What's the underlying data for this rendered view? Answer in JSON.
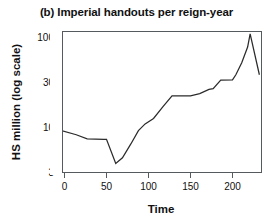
{
  "figure": {
    "title": "(b) Imperial handouts per reign-year",
    "background_color": "#ffffff",
    "line_color": "#2b2b2b",
    "axis_color": "#555a5e"
  },
  "chart_data": {
    "type": "line",
    "title": "(b) Imperial handouts per reign-year",
    "xlabel": "Time",
    "ylabel": "HS million (log scale)",
    "yscale": "log",
    "xlim": [
      -12,
      232
    ],
    "ylim": [
      3,
      120
    ],
    "grid": false,
    "legend": false,
    "xticks": [
      0,
      50,
      100,
      150,
      200
    ],
    "xtick_labels": [
      "0",
      "50",
      "100",
      "150",
      "200"
    ],
    "yticks": [
      3,
      10,
      30,
      100
    ],
    "ytick_labels": [
      "3",
      "10",
      "30",
      "100"
    ],
    "series": [
      {
        "name": "Imperial handouts per reign-year",
        "x": [
          -12,
          14,
          27,
          47,
          50,
          61,
          69,
          79,
          88,
          96,
          106,
          117,
          128,
          150,
          161,
          172,
          177,
          186,
          200,
          204,
          211,
          218,
          221,
          232
        ],
        "y": [
          9.4,
          8.0,
          7.2,
          7.1,
          7.1,
          3.8,
          4.4,
          6.3,
          8.9,
          10.6,
          12.2,
          16.5,
          22.0,
          22.0,
          23.3,
          26.0,
          26.5,
          33.0,
          33.3,
          38.0,
          52.0,
          78.0,
          110.0,
          38.0
        ]
      }
    ]
  }
}
